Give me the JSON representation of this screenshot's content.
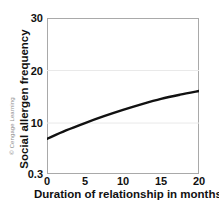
{
  "attribution": "© Cengage Learning",
  "chart_data": {
    "type": "line",
    "title": "",
    "subtitle": "",
    "xlabel": "Duration of relationship in months",
    "ylabel": "Social allergen frequency",
    "xlim": [
      0,
      20
    ],
    "ylim": [
      0.3,
      30
    ],
    "xticks": [
      "0",
      "5",
      "10",
      "15",
      "20"
    ],
    "xtick_values": [
      0,
      5,
      10,
      15,
      20
    ],
    "yticks": [
      "0.3",
      "10",
      "20",
      "30"
    ],
    "ytick_values": [
      0.3,
      10,
      20,
      30
    ],
    "grid": "horizontal-faint",
    "legend": "none",
    "annotations": [],
    "series": [
      {
        "name": "Social allergen frequency",
        "color": "#111111",
        "x": [
          0,
          2.5,
          5,
          7.5,
          10,
          12.5,
          15,
          17.5,
          20
        ],
        "values": [
          7.0,
          8.6,
          10.0,
          11.3,
          12.5,
          13.6,
          14.6,
          15.4,
          16.1
        ]
      }
    ]
  }
}
